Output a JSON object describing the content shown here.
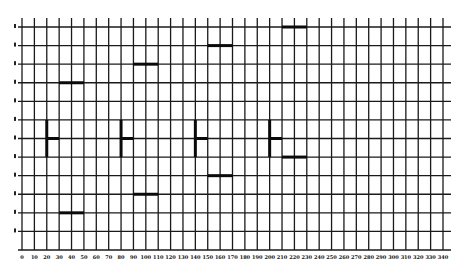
{
  "chart_data": {
    "type": "scatter",
    "title": "",
    "xlabel": "",
    "ylabel": "",
    "grid": true,
    "legend": null,
    "xlim": [
      0,
      340
    ],
    "x_ticks": [
      0,
      10,
      20,
      30,
      40,
      50,
      60,
      70,
      80,
      90,
      100,
      110,
      120,
      130,
      140,
      150,
      160,
      170,
      180,
      190,
      200,
      210,
      220,
      230,
      240,
      250,
      260,
      270,
      280,
      290,
      300,
      310,
      320,
      330,
      340
    ],
    "y_rows": 12,
    "y_tick_labels_note": "rotated labels, illegible",
    "series": [
      {
        "name": "horizontal-bars",
        "marker": "bar",
        "points": [
          {
            "x_start": 30,
            "x_end": 50,
            "row": 3
          },
          {
            "x_start": 30,
            "x_end": 50,
            "row": 10
          },
          {
            "x_start": 90,
            "x_end": 110,
            "row": 2
          },
          {
            "x_start": 90,
            "x_end": 110,
            "row": 9
          },
          {
            "x_start": 150,
            "x_end": 170,
            "row": 1
          },
          {
            "x_start": 150,
            "x_end": 170,
            "row": 8
          },
          {
            "x_start": 210,
            "x_end": 230,
            "row": 0
          },
          {
            "x_start": 210,
            "x_end": 230,
            "row": 7
          }
        ]
      },
      {
        "name": "t-markers",
        "marker": "T",
        "points": [
          {
            "x": 20,
            "row_top": 5,
            "row_bottom": 7,
            "stub_row": 6,
            "stub_len": 10
          },
          {
            "x": 80,
            "row_top": 5,
            "row_bottom": 7,
            "stub_row": 6,
            "stub_len": 10
          },
          {
            "x": 140,
            "row_top": 5,
            "row_bottom": 7,
            "stub_row": 6,
            "stub_len": 10
          },
          {
            "x": 200,
            "row_top": 5,
            "row_bottom": 7,
            "stub_row": 6,
            "stub_len": 10
          }
        ]
      }
    ]
  },
  "layout": {
    "grid_left": 22,
    "grid_right": 443,
    "grid_top": 27,
    "grid_bottom": 250,
    "tick_top": 18,
    "x_label_y": 259,
    "colors": {
      "line": "#1a1a1a",
      "marker": "#0a0a0a",
      "background": "#ffffff"
    }
  }
}
